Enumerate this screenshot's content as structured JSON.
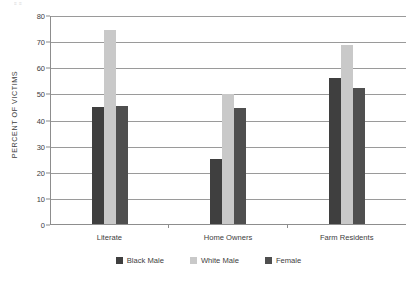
{
  "top_remnant": "≡ ≡",
  "chart_data": {
    "type": "bar",
    "title": "",
    "xlabel": "",
    "ylabel": "PERCENT OF VICTIMS",
    "ylim": [
      0,
      80
    ],
    "yticks": [
      0,
      10,
      20,
      30,
      40,
      50,
      60,
      70,
      80
    ],
    "ytick_labels": [
      "0",
      "10",
      "20",
      "30",
      "40",
      "50",
      "60",
      "70",
      "80"
    ],
    "grid": true,
    "legend_position": "bottom",
    "categories": [
      "Literate",
      "Home Owners",
      "Farm Residents"
    ],
    "series": [
      {
        "name": "Black Male",
        "color": "#3f3f3f",
        "values": [
          45,
          25,
          56
        ]
      },
      {
        "name": "White Male",
        "color": "#c9c9c9",
        "values": [
          74.5,
          50,
          69
        ]
      },
      {
        "name": "Female",
        "color": "#4f4f4f",
        "values": [
          45.5,
          44.5,
          52.5
        ]
      }
    ]
  }
}
